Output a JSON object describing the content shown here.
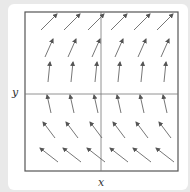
{
  "labels": {
    "x": "x",
    "y": "y"
  },
  "colors": {
    "background": "#e9e9e9",
    "panel": "#ffffff",
    "frame": "#555555",
    "axis": "#777777",
    "arrow": "#666666"
  },
  "plot": {
    "box": {
      "left": 25,
      "top": 12,
      "right": 178,
      "bottom": 171
    },
    "axis_x_at": 101,
    "axis_y_at": 94
  },
  "vector_field": {
    "columns_x": [
      49,
      72,
      96,
      119,
      142,
      165
    ],
    "rows": [
      {
        "y": 22,
        "dx": 8,
        "dy": -8
      },
      {
        "y": 48,
        "dx": 4,
        "dy": -9
      },
      {
        "y": 72,
        "dx": 1,
        "dy": -10
      },
      {
        "y": 104,
        "dx": -2,
        "dy": -9
      },
      {
        "y": 130,
        "dx": -6,
        "dy": -8
      },
      {
        "y": 155,
        "dx": -9,
        "dy": -7
      }
    ],
    "description": "All vectors point upward; horizontal component grows with y (right above axis, left below)."
  }
}
